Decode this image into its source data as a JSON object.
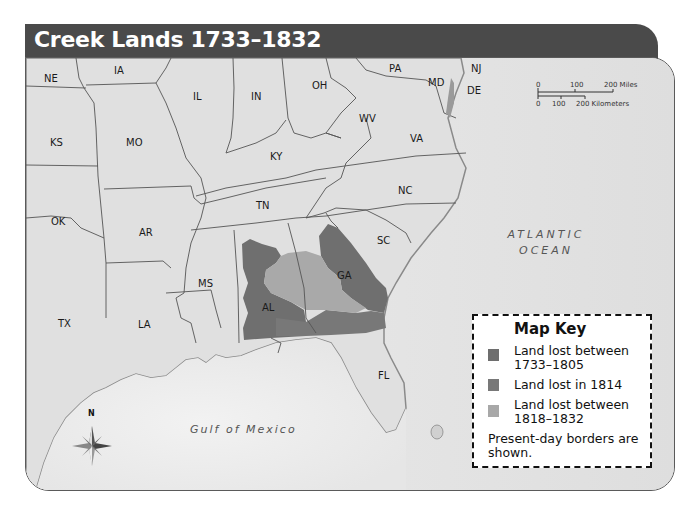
{
  "title": "Creek Lands 1733–1832",
  "states": [
    {
      "abbr": "NE",
      "x": 18,
      "y": 15
    },
    {
      "abbr": "IA",
      "x": 88,
      "y": 7
    },
    {
      "abbr": "IL",
      "x": 167,
      "y": 33
    },
    {
      "abbr": "IN",
      "x": 225,
      "y": 33
    },
    {
      "abbr": "OH",
      "x": 286,
      "y": 22
    },
    {
      "abbr": "PA",
      "x": 363,
      "y": 5
    },
    {
      "abbr": "NJ",
      "x": 445,
      "y": 5
    },
    {
      "abbr": "MD",
      "x": 402,
      "y": 19
    },
    {
      "abbr": "DE",
      "x": 441,
      "y": 27
    },
    {
      "abbr": "WV",
      "x": 333,
      "y": 55
    },
    {
      "abbr": "VA",
      "x": 384,
      "y": 75
    },
    {
      "abbr": "KS",
      "x": 24,
      "y": 79
    },
    {
      "abbr": "MO",
      "x": 100,
      "y": 79
    },
    {
      "abbr": "KY",
      "x": 244,
      "y": 93
    },
    {
      "abbr": "NC",
      "x": 372,
      "y": 127
    },
    {
      "abbr": "TN",
      "x": 230,
      "y": 142
    },
    {
      "abbr": "OK",
      "x": 25,
      "y": 158
    },
    {
      "abbr": "AR",
      "x": 113,
      "y": 169
    },
    {
      "abbr": "SC",
      "x": 351,
      "y": 177
    },
    {
      "abbr": "GA",
      "x": 311,
      "y": 212
    },
    {
      "abbr": "MS",
      "x": 172,
      "y": 220
    },
    {
      "abbr": "AL",
      "x": 236,
      "y": 244
    },
    {
      "abbr": "TX",
      "x": 32,
      "y": 260
    },
    {
      "abbr": "LA",
      "x": 112,
      "y": 261
    },
    {
      "abbr": "FL",
      "x": 352,
      "y": 312
    }
  ],
  "water_labels": {
    "atlantic_line1": "ATLANTIC",
    "atlantic_line2": "OCEAN",
    "gulf": "Gulf of Mexico"
  },
  "scale_bar": {
    "miles_ticks": [
      "0",
      "100",
      "200 Miles"
    ],
    "km_ticks": [
      "0",
      "100",
      "200 Kilometers"
    ]
  },
  "compass": {
    "north_label": "N"
  },
  "map_key": {
    "title": "Map Key",
    "items": [
      {
        "label_line1": "Land lost between",
        "label_line2": "1733–1805",
        "color": "#6e6e6e"
      },
      {
        "label_line1": "Land lost in 1814",
        "label_line2": "",
        "color": "#7a7a7a"
      },
      {
        "label_line1": "Land lost between",
        "label_line2": "1818–1832",
        "color": "#a8a8a8"
      }
    ],
    "note": "Present-day borders are shown."
  },
  "colors": {
    "land": "#e2e2e2",
    "water": "#efefef",
    "border": "#555555",
    "title_bar": "#4a4a4a",
    "lost_1733_1805": "#6e6e6e",
    "lost_1814": "#777777",
    "lost_1818_1832": "#a8a8a8"
  }
}
